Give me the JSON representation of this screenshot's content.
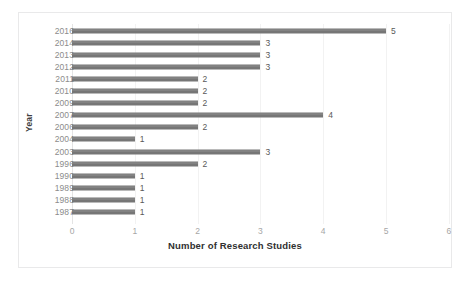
{
  "chart_data": {
    "type": "bar",
    "orientation": "horizontal",
    "title": "",
    "xlabel": "Number of Research Studies",
    "ylabel": "Year",
    "categories": [
      "2016",
      "2014",
      "2013",
      "2012",
      "2011",
      "2010",
      "2009",
      "2007",
      "2006",
      "2004",
      "2003",
      "1996",
      "1990",
      "1989",
      "1988",
      "1987"
    ],
    "values": [
      5,
      3,
      3,
      3,
      2,
      2,
      2,
      4,
      2,
      1,
      3,
      2,
      1,
      1,
      1,
      1
    ],
    "data_labels": [
      "5",
      "3",
      "3",
      "3",
      "2",
      "2",
      "2",
      "4",
      "2",
      "1",
      "3",
      "2",
      "1",
      "1",
      "1",
      "1"
    ],
    "xlim": [
      0,
      6
    ],
    "xticks": [
      "0",
      "1",
      "2",
      "3",
      "4",
      "5",
      "6"
    ],
    "grid": true,
    "legend": false,
    "bar_color": "#767676",
    "grid_color": "#f2f2f2",
    "axis_text_color": "#a6a6a6",
    "category_text_color": "#8c8c8c",
    "border_color": "#e9e9ea"
  }
}
